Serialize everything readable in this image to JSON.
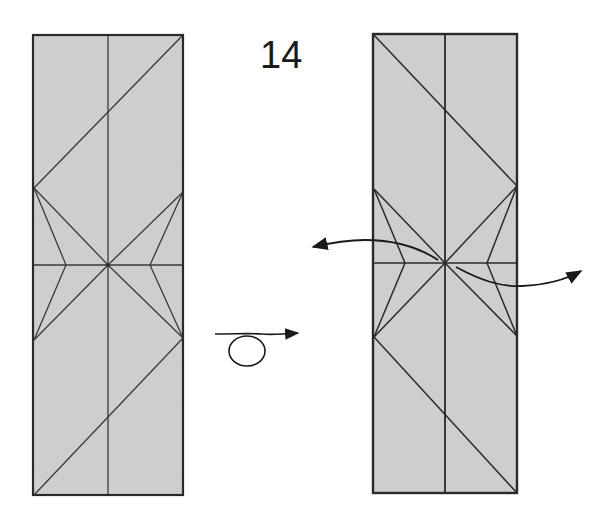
{
  "step": {
    "number": "14"
  },
  "colors": {
    "paper_fill": "#d0d0d0",
    "paper_edge": "#2a2a2a",
    "crease_line": "#3a3a3a",
    "arrow": "#1a1a1a",
    "background": "#ffffff"
  },
  "panels": [
    {
      "name": "before",
      "rect": {
        "x": 33,
        "y": 35,
        "w": 150,
        "h": 460
      },
      "midline_y": 265,
      "center_x": 108,
      "side_vertices": {
        "left_top": 188,
        "left_bottom": 340,
        "right_top": 192,
        "right_bottom": 338
      },
      "notches": {
        "left_x": 66,
        "right_x": 150
      },
      "diagonals": "top-right to left, bottom-left to right"
    },
    {
      "name": "after",
      "rect": {
        "x": 373,
        "y": 34,
        "w": 144,
        "h": 459
      },
      "midline_y": 263,
      "center_x": 445,
      "side_vertices": {
        "left_top": 189,
        "left_bottom": 337,
        "right_top": 186,
        "right_bottom": 336
      },
      "notches": {
        "left_x": 405,
        "right_x": 487
      },
      "diagonals": "top-left to right, bottom-right to left"
    }
  ],
  "symbols": [
    {
      "name": "turn-over-arrow",
      "meaning": "turn the model over"
    },
    {
      "name": "pull-left-arrow",
      "meaning": "pull flap outward to the left"
    },
    {
      "name": "pull-right-arrow",
      "meaning": "pull flap outward to the right"
    }
  ]
}
